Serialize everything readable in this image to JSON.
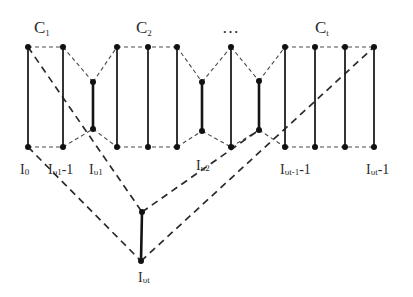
{
  "diagram": {
    "type": "graph",
    "cluster_labels": [
      {
        "id": "c1",
        "main": "C",
        "sub": "1",
        "x": 34,
        "y": 33
      },
      {
        "id": "c2",
        "main": "C",
        "sub": "2",
        "x": 136,
        "y": 33
      },
      {
        "id": "ellipsis",
        "main": "…",
        "sub": "",
        "x": 222,
        "y": 33
      },
      {
        "id": "ct",
        "main": "C",
        "sub": "t",
        "x": 315,
        "y": 33
      }
    ],
    "vertex_labels": [
      {
        "id": "i0",
        "main": "I",
        "sub": "0",
        "suffix": "",
        "x": 20,
        "y": 174
      },
      {
        "id": "iv1m1",
        "main": "I",
        "sub": "υ1",
        "suffix": "-1",
        "x": 48,
        "y": 174
      },
      {
        "id": "iv1",
        "main": "I",
        "sub": "υ1",
        "suffix": "",
        "x": 89,
        "y": 174
      },
      {
        "id": "iv2",
        "main": "I",
        "sub": "υ2",
        "suffix": "",
        "x": 196,
        "y": 170
      },
      {
        "id": "ivt1m1",
        "main": "I",
        "sub": "υt-1",
        "suffix": "-1",
        "x": 280,
        "y": 174
      },
      {
        "id": "ivtm1",
        "main": "I",
        "sub": "υt",
        "suffix": "-1",
        "x": 366,
        "y": 174
      },
      {
        "id": "ivt",
        "main": "I",
        "sub": "υt",
        "suffix": "",
        "x": 138,
        "y": 282
      }
    ],
    "nodes": {
      "top": [
        [
          28,
          47
        ],
        [
          63,
          47
        ],
        [
          117,
          47
        ],
        [
          148,
          47
        ],
        [
          177,
          47
        ],
        [
          231,
          47
        ],
        [
          285,
          47
        ],
        [
          315,
          47
        ],
        [
          345,
          47
        ],
        [
          374,
          47
        ]
      ],
      "mid_upper": [
        [
          93,
          82
        ],
        [
          202,
          82
        ],
        [
          259,
          81
        ]
      ],
      "mid_lower": [
        [
          93,
          129
        ],
        [
          202,
          131
        ],
        [
          259,
          130
        ]
      ],
      "bottom": [
        [
          28,
          147
        ],
        [
          63,
          147
        ],
        [
          117,
          147
        ],
        [
          148,
          147
        ],
        [
          177,
          147
        ],
        [
          231,
          147
        ],
        [
          285,
          147
        ],
        [
          315,
          147
        ],
        [
          345,
          147
        ],
        [
          374,
          147
        ]
      ],
      "extra": [
        [
          142,
          212
        ],
        [
          141,
          261
        ]
      ]
    },
    "edges_note": "solid verticals = cluster columns; dashed = connections"
  }
}
